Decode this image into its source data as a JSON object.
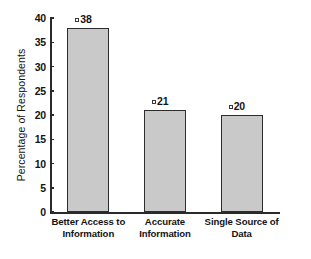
{
  "chart_data": {
    "type": "bar",
    "title": "",
    "subtitle": "",
    "xlabel": "",
    "ylabel": "Percentage of Respondents",
    "ylim": [
      0,
      40
    ],
    "yticks": [
      0,
      5,
      10,
      15,
      20,
      25,
      30,
      35,
      40
    ],
    "ytick_labels": [
      "0",
      "5",
      "10",
      "15",
      "20",
      "25",
      "30",
      "35",
      "40"
    ],
    "grid": false,
    "legend": false,
    "legend_position": "none",
    "categories": [
      "Better Access to Information",
      "Accurate Information",
      "Single Source of Data"
    ],
    "category_lines": [
      [
        "Better Access to",
        "Information"
      ],
      [
        "Accurate",
        "Information"
      ],
      [
        "Single Source of",
        "Data"
      ]
    ],
    "values": [
      38,
      21,
      20
    ],
    "value_labels": [
      "38",
      "21",
      "20"
    ],
    "colors": {
      "bar_fill": "#c9c9c9",
      "bar_edge": "#2d2d2d",
      "axis": "#2a2a2a",
      "text": "#141414",
      "background": "#ffffff"
    }
  }
}
